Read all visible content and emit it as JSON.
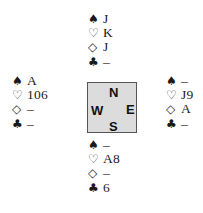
{
  "suits": {
    "spades": "♠",
    "hearts": "♡",
    "diamonds": "◇",
    "clubs": "♣"
  },
  "compass": {
    "north": "N",
    "west": "W",
    "east": "E",
    "south": "S",
    "fill_color": "#dcdcdc",
    "border_color": "#555555"
  },
  "hands": {
    "north": {
      "spades": "J",
      "hearts": "K",
      "diamonds": "J",
      "clubs": "–"
    },
    "west": {
      "spades": "A",
      "hearts": "106",
      "diamonds": "–",
      "clubs": "–"
    },
    "east": {
      "spades": "–",
      "hearts": "J9",
      "diamonds": "A",
      "clubs": "–"
    },
    "south": {
      "spades": "–",
      "hearts": "A8",
      "diamonds": "–",
      "clubs": "6"
    }
  }
}
